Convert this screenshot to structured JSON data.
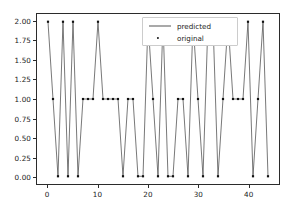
{
  "chart_data": {
    "type": "line",
    "title": "",
    "xlabel": "",
    "ylabel": "",
    "xlim": [
      -2.2,
      46.2
    ],
    "ylim": [
      -0.1,
      2.1
    ],
    "grid": false,
    "legend_position": "upper center",
    "xticks": [
      0,
      10,
      20,
      30,
      40
    ],
    "xtick_labels": [
      "0",
      "10",
      "20",
      "30",
      "40"
    ],
    "yticks": [
      0.0,
      0.25,
      0.5,
      0.75,
      1.0,
      1.25,
      1.5,
      1.75,
      2.0
    ],
    "ytick_labels": [
      "0.00",
      "0.25",
      "0.50",
      "0.75",
      "1.00",
      "1.25",
      "1.50",
      "1.75",
      "2.00"
    ],
    "x": [
      0,
      1,
      2,
      3,
      4,
      5,
      6,
      7,
      8,
      9,
      10,
      11,
      12,
      13,
      14,
      15,
      16,
      17,
      18,
      19,
      20,
      21,
      22,
      23,
      24,
      25,
      26,
      27,
      28,
      29,
      30,
      31,
      32,
      33,
      34,
      35,
      36,
      37,
      38,
      39,
      40,
      41,
      42,
      43,
      44
    ],
    "series": [
      {
        "name": "predicted",
        "style": "line",
        "color": "#555555",
        "values": [
          2,
          1,
          0,
          2,
          0,
          2,
          0,
          1,
          1,
          1,
          2,
          1,
          1,
          1,
          1,
          0,
          1,
          1,
          0,
          0,
          2,
          1,
          0,
          2,
          0,
          0,
          1,
          1,
          0,
          2,
          1,
          0,
          2,
          2,
          0,
          1,
          2,
          1,
          1,
          1,
          2,
          0,
          1,
          2,
          0
        ]
      },
      {
        "name": "original",
        "style": "marker",
        "color": "#111111",
        "values": [
          2,
          1,
          0,
          2,
          0,
          2,
          0,
          1,
          1,
          1,
          2,
          1,
          1,
          1,
          1,
          0,
          1,
          1,
          0,
          0,
          2,
          1,
          0,
          2,
          0,
          0,
          1,
          1,
          0,
          2,
          1,
          0,
          2,
          2,
          0,
          1,
          2,
          1,
          1,
          1,
          2,
          0,
          1,
          2,
          0
        ]
      }
    ]
  },
  "legend": {
    "entries": [
      {
        "label": "predicted",
        "key": "line-key"
      },
      {
        "label": "original",
        "key": "dot-key"
      }
    ]
  }
}
